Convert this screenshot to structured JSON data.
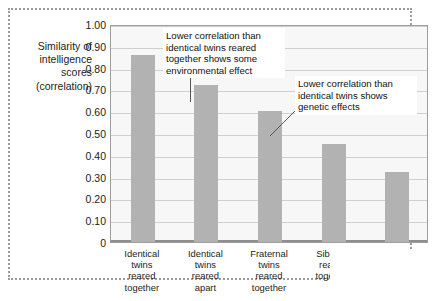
{
  "chart_data": {
    "type": "bar",
    "title": "",
    "xlabel": "",
    "ylabel": "Similarity of intelligence scores (correlation)",
    "ylim": [
      0,
      1.0
    ],
    "grid": true,
    "legend": "none",
    "categories": [
      "Identical twins reared together",
      "Identical twins reared apart",
      "Fraternal twins reared together",
      "Siblings reared together",
      "Unrelated individuals reared together"
    ],
    "values": [
      0.86,
      0.72,
      0.6,
      0.45,
      0.32
    ],
    "ytick_labels": [
      "1.00",
      "0.90",
      "0.80",
      "0.70",
      "0.60",
      "0.50",
      "0.40",
      "0.30",
      "0.20",
      "0.10",
      "0"
    ],
    "ytick_values": [
      1.0,
      0.9,
      0.8,
      0.7,
      0.6,
      0.5,
      0.4,
      0.3,
      0.2,
      0.1,
      0
    ],
    "annotations": [
      "Lower correlation than identical twins reared together shows some environmental effect",
      "Lower correlation than identical twins shows genetic effects"
    ],
    "bar_color": "#b2b2b2",
    "plot_background": "#f7f7f7"
  },
  "axis_title_lines": [
    "Similarity of",
    "intelligence",
    "scores",
    "(correlation)"
  ],
  "xlabel_lines": [
    [
      "Identical",
      "twins",
      "reared",
      "together"
    ],
    [
      "Identical",
      "twins",
      "reared",
      "apart"
    ],
    [
      "Fraternal",
      "twins",
      "reared",
      "together"
    ],
    [
      "Siblings",
      "reared",
      "together"
    ],
    [
      "Unrelated",
      "individuals",
      "reared",
      "together"
    ]
  ],
  "annotation_1": {
    "line1": "Lower correlation than",
    "line2": "identical twins reared",
    "line3": "together shows some",
    "line4": "environmental effect"
  },
  "annotation_2": {
    "line1": "Lower correlation than",
    "line2": "identical twins shows",
    "line3": "genetic effects"
  }
}
